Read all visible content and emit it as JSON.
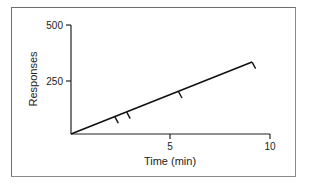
{
  "chart_data": {
    "type": "line",
    "title": "",
    "xlabel": "Time (min)",
    "ylabel": "Responses",
    "xlim": [
      0,
      10
    ],
    "ylim": [
      0,
      500
    ],
    "xticks": [
      5,
      10
    ],
    "yticks": [
      250,
      500
    ],
    "grid": false,
    "legend": null,
    "series": [
      {
        "name": "cumulative responses",
        "x": [
          0,
          9.1
        ],
        "y": [
          0,
          330
        ]
      }
    ],
    "annotations": {
      "hash_marks": [
        {
          "x": 2.2,
          "y": 80
        },
        {
          "x": 2.8,
          "y": 100
        },
        {
          "x": 5.4,
          "y": 195
        },
        {
          "x": 9.1,
          "y": 330
        }
      ],
      "note": "Short downward hash marks on the cumulative record line (reinforcement marks)"
    }
  },
  "labels": {
    "x_axis": "Time (min)",
    "y_axis": "Responses",
    "x_tick_5": "5",
    "x_tick_10": "10",
    "y_tick_250": "250",
    "y_tick_500": "500"
  }
}
